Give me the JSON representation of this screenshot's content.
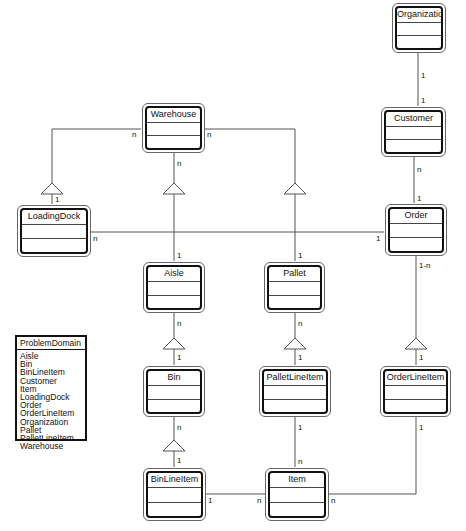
{
  "diagram": {
    "type": "UML class diagram",
    "classes": {
      "organization": "Organization",
      "customer": "Customer",
      "warehouse": "Warehouse",
      "loadingdock": "LoadingDock",
      "order": "Order",
      "aisle": "Aisle",
      "pallet": "Pallet",
      "bin": "Bin",
      "palletlineitem": "PalletLineItem",
      "orderlineitem": "OrderLineItem",
      "binlineitem": "BinLineItem",
      "item": "Item"
    },
    "multiplicities": {
      "org_customer_top": "1",
      "org_customer_bottom": "1",
      "customer_order_top": "n",
      "customer_order_bottom": "1",
      "warehouse_left": "n",
      "warehouse_right": "n",
      "warehouse_bottom": "n",
      "loadingdock_top": "1",
      "loadingdock_right": "n",
      "order_left": "1",
      "order_bottom": "1-n",
      "aisle_top": "1",
      "pallet_top": "1",
      "aisle_bottom": "n",
      "bin_top": "1",
      "pallet_bottom": "n",
      "palletlineitem_top": "1",
      "orderlineitem_top": "1",
      "bin_bottom": "n",
      "binlineitem_top": "1",
      "palletlineitem_bottom": "1",
      "item_top": "n",
      "orderlineitem_bottom": "1",
      "binlineitem_right": "1",
      "item_left": "n",
      "item_right": "n"
    },
    "relationships": [
      {
        "from": "Organization",
        "to": "Customer",
        "kind": "association",
        "mult": [
          "1",
          "1"
        ]
      },
      {
        "from": "Customer",
        "to": "Order",
        "kind": "association",
        "mult": [
          "n",
          "1"
        ]
      },
      {
        "from": "Warehouse",
        "to": "LoadingDock",
        "kind": "aggregation",
        "mult": [
          "n",
          "1"
        ]
      },
      {
        "from": "Warehouse",
        "to": "Aisle",
        "kind": "aggregation",
        "mult": [
          "n",
          "1"
        ]
      },
      {
        "from": "Warehouse",
        "to": "Pallet",
        "kind": "aggregation",
        "mult": [
          "n",
          "1"
        ]
      },
      {
        "from": "LoadingDock",
        "to": "Order",
        "kind": "association",
        "mult": [
          "n",
          "1"
        ]
      },
      {
        "from": "Aisle",
        "to": "Bin",
        "kind": "aggregation",
        "mult": [
          "n",
          "1"
        ]
      },
      {
        "from": "Pallet",
        "to": "PalletLineItem",
        "kind": "aggregation",
        "mult": [
          "n",
          "1"
        ]
      },
      {
        "from": "Order",
        "to": "OrderLineItem",
        "kind": "aggregation",
        "mult": [
          "1-n",
          "1"
        ]
      },
      {
        "from": "Bin",
        "to": "BinLineItem",
        "kind": "aggregation",
        "mult": [
          "n",
          "1"
        ]
      },
      {
        "from": "PalletLineItem",
        "to": "Item",
        "kind": "association",
        "mult": [
          "1",
          "n"
        ]
      },
      {
        "from": "BinLineItem",
        "to": "Item",
        "kind": "association",
        "mult": [
          "1",
          "n"
        ]
      },
      {
        "from": "OrderLineItem",
        "to": "Item",
        "kind": "association",
        "mult": [
          "1",
          "n"
        ]
      }
    ]
  },
  "legend": {
    "title": "ProblemDomain",
    "items": [
      "Aisle",
      "Bin",
      "BinLineItem",
      "Customer",
      "Item",
      "LoadingDock",
      "Order",
      "OrderLineItem",
      "Organization",
      "Pallet",
      "PalletLineItem",
      "Warehouse"
    ]
  },
  "colors": {
    "line": "#555555",
    "box_border": "#111111",
    "background": "#ffffff"
  }
}
